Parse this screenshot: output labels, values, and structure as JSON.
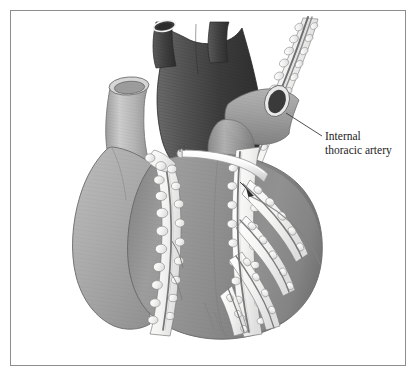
{
  "figure": {
    "domain_kind": "anatomical-illustration",
    "background_color": "#ffffff",
    "frame": {
      "border_color": "#8d8d8d",
      "border_width_px": 1,
      "x": 10,
      "y": 10,
      "width": 396,
      "height": 356
    }
  },
  "annotations": [
    {
      "id": "internal-thoracic-artery",
      "line1": "Internal",
      "line2": "thoracic artery",
      "text_x": 325,
      "text_y": 140,
      "line_height": 14,
      "leader": {
        "from_x": 322,
        "from_y": 136,
        "to_x": 286,
        "to_y": 113,
        "color": "#3a3a3a",
        "width": 0.9
      }
    }
  ],
  "palette": {
    "background": "#ffffff",
    "frame_border": "#8d8d8d",
    "pulmonary_trunk_dark": "#4d4d4d",
    "pulmonary_trunk_shadow": "#3a3a3a",
    "vena_cava_light": "#b9b9b9",
    "aorta_mid": "#9a9a9a",
    "ventricle_body": "#8e8e8e",
    "ventricle_highlight": "#b4b4b4",
    "atrial_appendage": "#a8a8a8",
    "epicardial_fat": "#f2f2f0",
    "fat_outline": "#7b7b7b",
    "coronary_vessel": "#7a7a7a",
    "graft_white": "#fcfcfc",
    "graft_shadow": "#cfcfcf",
    "vessel_lumen_dark": "#3d3d3d",
    "cut_rim_white": "#f6f6f6",
    "label_text": "#1c1c1c",
    "leader_line": "#3a3a3a"
  },
  "structures": [
    {
      "name": "superior-vena-cava",
      "label": "Superior vena cava (cut)",
      "tone": "light-gray"
    },
    {
      "name": "pulmonary-trunk",
      "label": "Pulmonary trunk and branches (cut)",
      "tone": "dark-gray"
    },
    {
      "name": "aorta",
      "label": "Aorta (cut)",
      "tone": "mid-gray"
    },
    {
      "name": "right-pulmonary-vessel",
      "label": "Right pulmonary vessel (cut)",
      "tone": "mid-gray"
    },
    {
      "name": "right-atrial-appendage",
      "label": "Right atrial appendage",
      "tone": "light-gray"
    },
    {
      "name": "right-ventricle",
      "label": "Right ventricle",
      "tone": "mid-gray"
    },
    {
      "name": "left-ventricle",
      "label": "Left ventricle",
      "tone": "mid-gray"
    },
    {
      "name": "internal-thoracic-artery-pedicle",
      "label": "Internal thoracic artery pedicle",
      "tone": "white-fat"
    },
    {
      "name": "bypass-graft-conduit",
      "label": "Bypass graft conduit",
      "tone": "white"
    },
    {
      "name": "coronary-arteries",
      "label": "Coronary arteries in epicardial fat",
      "tone": "white-fat"
    },
    {
      "name": "anastomosis-site",
      "label": "Distal anastomosis site",
      "tone": "marker"
    }
  ]
}
